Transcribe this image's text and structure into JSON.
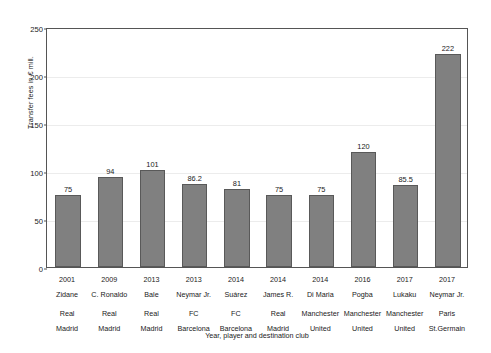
{
  "chart_data": {
    "type": "bar",
    "title": "",
    "xlabel": "Year, player and destination club",
    "ylabel": "Transfer fees in € mill.",
    "ylim": [
      0,
      250
    ],
    "yticks": [
      0,
      50,
      100,
      150,
      200,
      250
    ],
    "grid": true,
    "legend": null,
    "categories": [
      "2001 Zidane Real Madrid",
      "2009 C. Ronaldo Real Madrid",
      "2013 Bale Real Madrid",
      "2013 Neymar Jr. FC Barcelona",
      "2014 Suárez FC Barcelona",
      "2014 James R. Real Madrid",
      "2014 Di Maria Manchester United",
      "2016 Pogba Manchester United",
      "2017 Lukaku Manchester United",
      "2017 Neymar Jr. Paris St.Germain"
    ],
    "values": [
      75,
      94,
      101,
      86.2,
      81,
      75,
      75,
      120,
      85.5,
      222
    ],
    "value_labels": [
      "75",
      "94",
      "101",
      "86.2",
      "81",
      "75",
      "75",
      "120",
      "85.5",
      "222"
    ],
    "bar_color": "#808080",
    "bar_edge_color": "#595959",
    "grid_color": "#ececec",
    "axis_color": "#555555",
    "background_color": "#ffffff",
    "points": [
      {
        "year": "2001",
        "player": "Zidane",
        "club_line1": "Real",
        "club_line2": "Madrid",
        "value": 75,
        "label": "75"
      },
      {
        "year": "2009",
        "player": "C. Ronaldo",
        "club_line1": "Real",
        "club_line2": "Madrid",
        "value": 94,
        "label": "94"
      },
      {
        "year": "2013",
        "player": "Bale",
        "club_line1": "Real",
        "club_line2": "Madrid",
        "value": 101,
        "label": "101"
      },
      {
        "year": "2013",
        "player": "Neymar Jr.",
        "club_line1": "FC",
        "club_line2": "Barcelona",
        "value": 86.2,
        "label": "86.2"
      },
      {
        "year": "2014",
        "player": "Suárez",
        "club_line1": "FC",
        "club_line2": "Barcelona",
        "value": 81,
        "label": "81"
      },
      {
        "year": "2014",
        "player": "James R.",
        "club_line1": "Real",
        "club_line2": "Madrid",
        "value": 75,
        "label": "75"
      },
      {
        "year": "2014",
        "player": "Di Maria",
        "club_line1": "Manchester",
        "club_line2": "United",
        "value": 75,
        "label": "75"
      },
      {
        "year": "2016",
        "player": "Pogba",
        "club_line1": "Manchester",
        "club_line2": "United",
        "value": 120,
        "label": "120"
      },
      {
        "year": "2017",
        "player": "Lukaku",
        "club_line1": "Manchester",
        "club_line2": "United",
        "value": 85.5,
        "label": "85.5"
      },
      {
        "year": "2017",
        "player": "Neymar Jr.",
        "club_line1": "Paris",
        "club_line2": "St.Germain",
        "value": 222,
        "label": "222"
      }
    ]
  }
}
